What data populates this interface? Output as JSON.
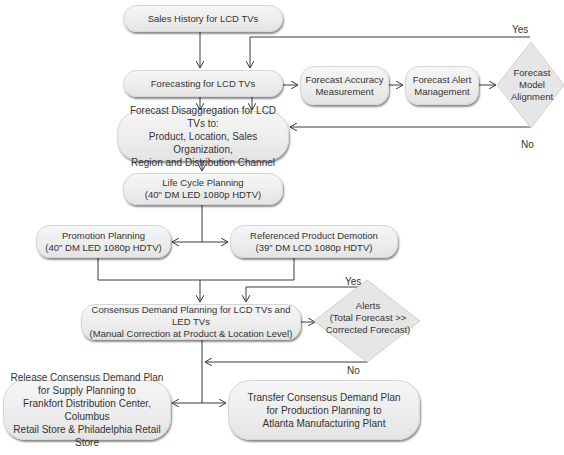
{
  "diagram": {
    "nodes": {
      "sales_history": "Sales History  for LCD TVs",
      "forecasting": "Forecasting for LCD TVs",
      "forecast_accuracy": "Forecast Accuracy\nMeasurement",
      "forecast_alert": "Forecast  Alert\nManagement",
      "forecast_model_alignment": "Forecast\nModel\nAlignment",
      "forecast_disaggregation": "Forecast Disaggregation for LCD TVs to:\nProduct, Location, Sales Organization,\nRegion and Distribution Channel",
      "life_cycle_planning": "Life Cycle Planning\n(40\" DM LED 1080p HDTV)",
      "promotion_planning": "Promotion Planning\n(40\" DM LED 1080p HDTV)",
      "referenced_product_demotion": "Referenced Product Demotion\n(39\" DM LCD 1080p HDTV)",
      "consensus_demand_planning": "Consensus Demand Planning for LCD TVs and LED TVs\n(Manual Correction at Product & Location Level)",
      "alerts": "Alerts\n(Total Forecast >>\nCorrected Forecast)",
      "release_consensus": "Release Consensus Demand Plan\nfor Supply Planning to\nFrankfort Distribution Center, Columbus\nRetail Store & Philadelphia Retail Store",
      "transfer_consensus": "Transfer Consensus Demand Plan\nfor Production Planning to\nAtlanta Manufacturing Plant"
    },
    "edge_labels": {
      "model_alignment_yes": "Yes",
      "model_alignment_no": "No",
      "alerts_yes": "Yes",
      "alerts_no": "No"
    },
    "colors": {
      "line": "#3a3a3a",
      "box_fill": "#ececec",
      "diamond_fill": "#e6e6e6",
      "text": "#333333"
    }
  }
}
